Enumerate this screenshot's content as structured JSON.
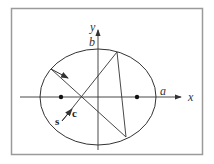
{
  "diagram": {
    "frame_color": "#9a9a9a",
    "line_color": "#333333",
    "labels": {
      "y_axis": "y",
      "x_axis": "x",
      "semi_minor": "b",
      "semi_major": "a",
      "source": "s",
      "direction": "c"
    },
    "ellipse": {
      "cx": 98,
      "cy": 97,
      "rx": 58,
      "ry": 48
    },
    "foci": [
      {
        "x": 61,
        "y": 97
      },
      {
        "x": 137,
        "y": 97
      }
    ]
  }
}
